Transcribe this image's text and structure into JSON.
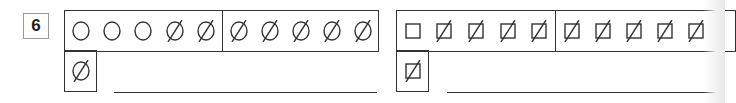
{
  "question": {
    "number": "6"
  },
  "left_panel": {
    "symbol_type": "circle",
    "groups": [
      {
        "marks": [
          "empty-circle",
          "empty-circle",
          "empty-circle",
          "crossed-circle",
          "crossed-circle"
        ]
      },
      {
        "marks": [
          "crossed-circle",
          "crossed-circle",
          "crossed-circle",
          "crossed-circle",
          "crossed-circle"
        ]
      }
    ],
    "extra_mark": "crossed-circle",
    "answer_value": ""
  },
  "right_panel": {
    "symbol_type": "square",
    "groups": [
      {
        "marks": [
          "empty-square",
          "crossed-square",
          "crossed-square",
          "crossed-square",
          "crossed-square"
        ]
      },
      {
        "marks": [
          "crossed-square",
          "crossed-square",
          "crossed-square",
          "crossed-square",
          "crossed-square"
        ]
      }
    ],
    "extra_mark": "crossed-square",
    "answer_value": ""
  },
  "colors": {
    "ink": "#333333",
    "label_border": "#999999",
    "background": "#ffffff"
  }
}
